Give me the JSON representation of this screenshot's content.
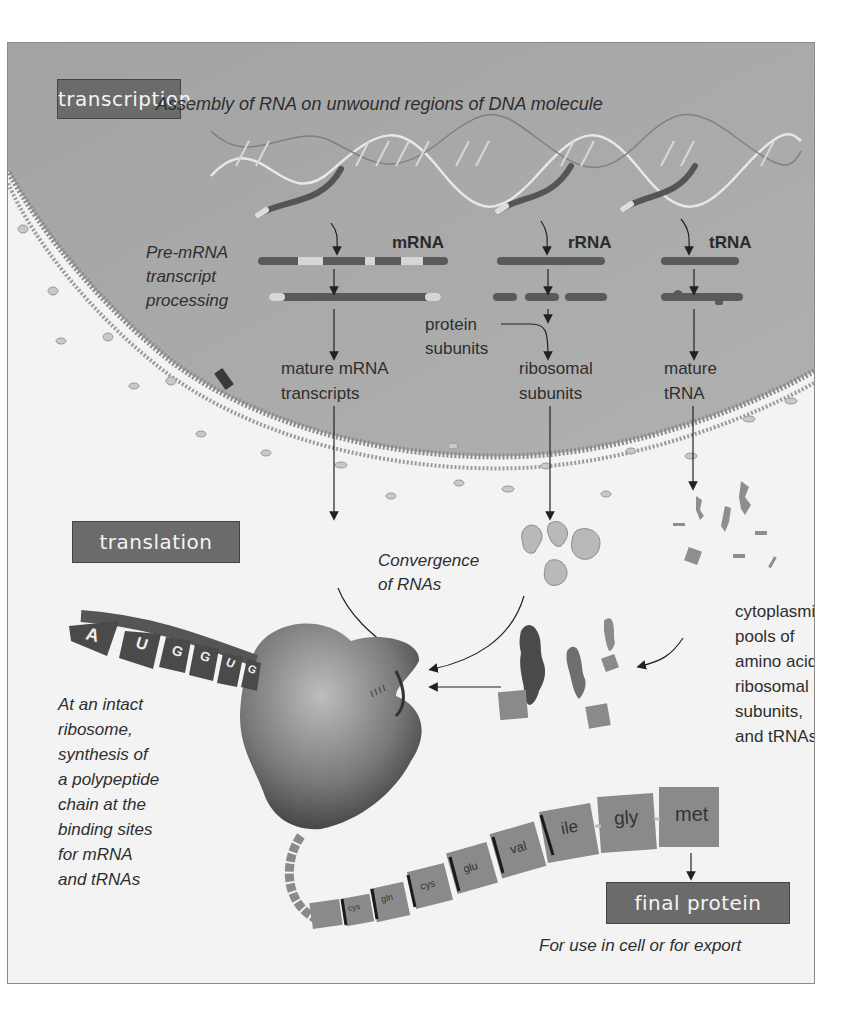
{
  "transcription": {
    "label": "transcription",
    "caption": "Assembly of RNA on unwound regions of DNA molecule",
    "rna_types": [
      "mRNA",
      "rRNA",
      "tRNA"
    ],
    "processing_label_lines": [
      "Pre-mRNA",
      "transcript",
      "processing"
    ],
    "protein_subunits_lines": [
      "protein",
      "subunits"
    ],
    "products": [
      {
        "lines": [
          "mature mRNA",
          "transcripts"
        ]
      },
      {
        "lines": [
          "ribosomal",
          "subunits"
        ]
      },
      {
        "lines": [
          "mature",
          "tRNA"
        ]
      }
    ]
  },
  "translation": {
    "label": "translation",
    "convergence_lines": [
      "Convergence",
      "of RNAs"
    ],
    "cytoplasmic_lines": [
      "cytoplasmic",
      "pools of",
      "amino acids,",
      "ribosomal",
      "subunits,",
      "and tRNAs"
    ],
    "ribosome_lines": [
      "At an intact",
      "ribosome,",
      "synthesis of",
      "a polypeptide",
      "chain at the",
      "binding sites",
      "for mRNA",
      "and tRNAs"
    ],
    "mrna_codon_letters": [
      "A",
      "U",
      "G",
      "G",
      "U",
      "G"
    ],
    "amino_acids": [
      "cys",
      "gln",
      "cys",
      "glu",
      "val",
      "ile",
      "gly",
      "met"
    ]
  },
  "final": {
    "label": "final protein",
    "caption": "For use in cell or for export"
  },
  "colors": {
    "label_box": "#6b6b6b",
    "nucleus": "#a9a9a9",
    "cytoplasm": "#f3f3f3",
    "amino_acid_block": "#8c8c8c",
    "rna_strand": "#555555"
  }
}
